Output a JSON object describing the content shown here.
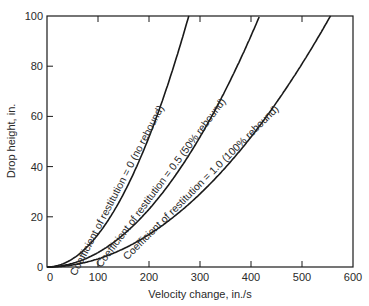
{
  "chart_data": {
    "type": "line",
    "title": "",
    "xlabel": "Velocity change, in./s",
    "ylabel": "Drop height, in.",
    "xlim": [
      0,
      600
    ],
    "ylim": [
      0,
      100
    ],
    "xticks": [
      0,
      100,
      200,
      300,
      400,
      500,
      600
    ],
    "yticks": [
      0,
      20,
      40,
      60,
      80,
      100
    ],
    "grid": false,
    "legend": "inline labels along curves",
    "series": [
      {
        "name": "Coefficient of restitution = 0 (no rebound)",
        "e": 0,
        "x": [
          0,
          50,
          100,
          150,
          200,
          250,
          278
        ],
        "y": [
          0,
          3.2,
          13.0,
          29.1,
          51.8,
          80.9,
          100
        ]
      },
      {
        "name": "Coefficient of restitution = 0.5 (50% rebound)",
        "e": 0.5,
        "x": [
          0,
          50,
          100,
          150,
          200,
          250,
          300,
          350,
          400,
          417
        ],
        "y": [
          0,
          1.4,
          5.8,
          12.9,
          23.0,
          36.0,
          51.8,
          70.5,
          92.1,
          100
        ]
      },
      {
        "name": "Coefficient of restitution = 1.0 (100% rebound)",
        "e": 1.0,
        "x": [
          0,
          50,
          100,
          150,
          200,
          250,
          300,
          350,
          400,
          450,
          500,
          556
        ],
        "y": [
          0,
          0.8,
          3.2,
          7.3,
          13.0,
          20.2,
          29.1,
          39.7,
          51.8,
          65.6,
          80.9,
          100
        ]
      }
    ]
  },
  "axes": {
    "xlabel": "Velocity change, in./s",
    "ylabel": "Drop height, in.",
    "xtick_labels": [
      "0",
      "100",
      "200",
      "300",
      "400",
      "500",
      "600"
    ],
    "ytick_labels": [
      "0",
      "20",
      "40",
      "60",
      "80",
      "100"
    ]
  },
  "curve_labels": [
    "Coefficient of restitution = 0 (no rebound)",
    "Coefficient of restitution = 0.5 (50% rebound)",
    "Coefficient of restitution = 1.0 (100% rebound)"
  ],
  "colors": {
    "line": "#1a1a1a",
    "text": "#2a2a2a",
    "background": "#ffffff"
  }
}
